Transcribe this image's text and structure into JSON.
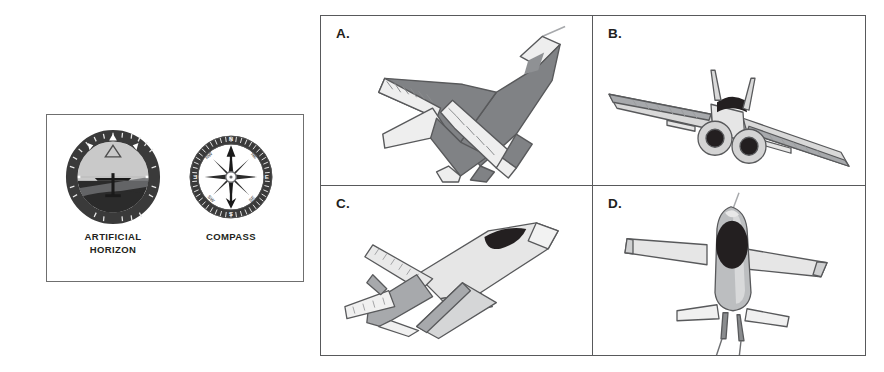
{
  "page": {
    "background_color": "#ffffff",
    "width": 884,
    "height": 372
  },
  "instrument_panel": {
    "border_color": "#6f6f6f",
    "instruments": [
      {
        "id": "artificial-horizon",
        "icon": "artificial-horizon-gauge-icon",
        "label_line1": "ARTIFICIAL",
        "label_line2": "HORIZON",
        "bezel_color": "#3a3a3a",
        "sky_color": "#c9c9c9",
        "ground_color": "#2b2b2b"
      },
      {
        "id": "compass",
        "icon": "compass-gauge-icon",
        "label_line1": "COMPASS",
        "label_line2": "",
        "bezel_color": "#3a3a3a",
        "dial_color": "#ffffff",
        "needle_color": "#1a1a1a",
        "cardinals": [
          "N",
          "E",
          "S",
          "W"
        ]
      }
    ]
  },
  "quad_panel": {
    "border_color": "#58595b",
    "items": [
      {
        "letter": "A.",
        "icon": "fighter-jet-top-front-icon",
        "description": "Delta-wing fighter jet viewed from above and front, dark gray body with light stripes",
        "body_color": "#808285",
        "highlight_color": "#e8e8e8",
        "outline_color": "#58595b"
      },
      {
        "letter": "B.",
        "icon": "fighter-jet-rear-icon",
        "description": "Twin-engine swept-wing jet viewed from directly behind, engine nozzles visible",
        "body_color": "#d9d9d9",
        "highlight_color": "#a7a9ac",
        "outline_color": "#58595b",
        "nozzle_color": "#231f20"
      },
      {
        "letter": "C.",
        "icon": "jet-side-quarter-icon",
        "description": "Single-seat jet viewed from the side and slightly above, dark canopy",
        "body_color": "#e6e6e6",
        "highlight_color": "#a7a9ac",
        "outline_color": "#58595b",
        "canopy_color": "#231f20"
      },
      {
        "letter": "D.",
        "icon": "jet-top-down-icon",
        "description": "Straight-wing jet viewed from directly above, dark oval canopy",
        "body_color": "#bcbec0",
        "highlight_color": "#e6e6e6",
        "outline_color": "#58595b",
        "canopy_color": "#231f20"
      }
    ]
  }
}
